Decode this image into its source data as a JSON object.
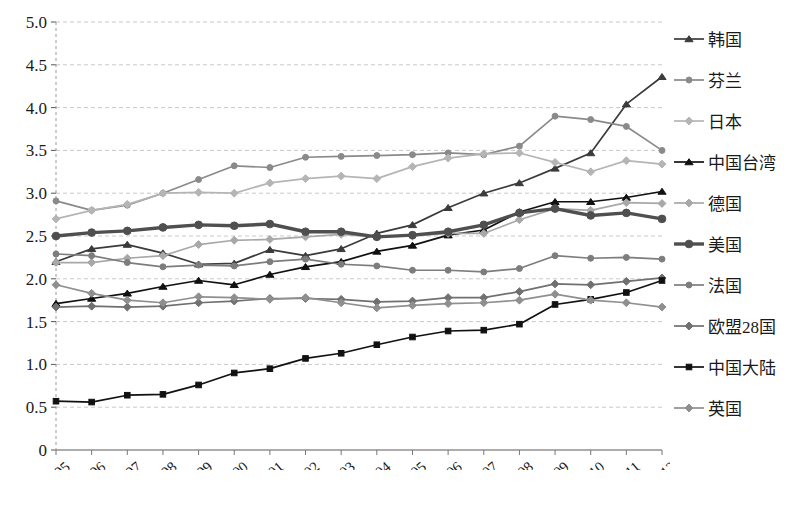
{
  "chart_data": {
    "type": "line",
    "title": "",
    "xlabel": "",
    "ylabel": "",
    "ylim": [
      0,
      5.0
    ],
    "yticks": [
      "0",
      "0.5",
      "1.0",
      "1.5",
      "2.0",
      "2.5",
      "3.0",
      "3.5",
      "4.0",
      "4.5",
      "5.0"
    ],
    "grid": true,
    "legend_position": "right",
    "categories": [
      "1995",
      "1996",
      "1997",
      "1998",
      "1999",
      "2000",
      "2001",
      "2002",
      "2003",
      "2004",
      "2005",
      "2006",
      "2007",
      "2008",
      "2009",
      "2010",
      "2011",
      "2012"
    ],
    "series": [
      {
        "name": "韩国",
        "marker": "triangle",
        "color": "#3b3b3b",
        "values": [
          2.2,
          2.35,
          2.4,
          2.3,
          2.17,
          2.18,
          2.34,
          2.27,
          2.35,
          2.53,
          2.63,
          2.83,
          3.0,
          3.12,
          3.29,
          3.47,
          4.04,
          4.36
        ]
      },
      {
        "name": "芬兰",
        "marker": "circle",
        "color": "#8a8a8a",
        "values": [
          2.91,
          2.8,
          2.86,
          3.0,
          3.16,
          3.32,
          3.3,
          3.42,
          3.43,
          3.44,
          3.45,
          3.47,
          3.45,
          3.55,
          3.9,
          3.86,
          3.78,
          3.5
        ]
      },
      {
        "name": "日本",
        "marker": "diamond",
        "color": "#b5b5b5",
        "values": [
          2.7,
          2.8,
          2.87,
          3.0,
          3.01,
          3.0,
          3.12,
          3.17,
          3.2,
          3.17,
          3.31,
          3.41,
          3.46,
          3.47,
          3.36,
          3.25,
          3.38,
          3.34
        ]
      },
      {
        "name": "中国台湾",
        "marker": "triangle",
        "color": "#111111",
        "values": [
          1.71,
          1.77,
          1.83,
          1.91,
          1.98,
          1.93,
          2.05,
          2.14,
          2.2,
          2.32,
          2.39,
          2.51,
          2.57,
          2.78,
          2.9,
          2.9,
          2.95,
          3.02
        ]
      },
      {
        "name": "德国",
        "marker": "diamond",
        "color": "#a8a8a8",
        "values": [
          2.19,
          2.19,
          2.24,
          2.27,
          2.4,
          2.45,
          2.46,
          2.49,
          2.52,
          2.49,
          2.5,
          2.53,
          2.53,
          2.69,
          2.82,
          2.8,
          2.89,
          2.88
        ]
      },
      {
        "name": "美国",
        "marker": "circle",
        "color": "#4f4f4f",
        "values": [
          2.5,
          2.54,
          2.56,
          2.6,
          2.63,
          2.62,
          2.64,
          2.55,
          2.55,
          2.49,
          2.51,
          2.55,
          2.63,
          2.77,
          2.82,
          2.74,
          2.77,
          2.7
        ]
      },
      {
        "name": "法国",
        "marker": "circle",
        "color": "#7d7d7d",
        "values": [
          2.29,
          2.27,
          2.19,
          2.14,
          2.16,
          2.15,
          2.2,
          2.23,
          2.17,
          2.15,
          2.1,
          2.1,
          2.08,
          2.12,
          2.27,
          2.24,
          2.25,
          2.23
        ]
      },
      {
        "name": "欧盟28国",
        "marker": "diamond",
        "color": "#707070",
        "values": [
          1.67,
          1.68,
          1.67,
          1.68,
          1.72,
          1.74,
          1.77,
          1.77,
          1.76,
          1.73,
          1.74,
          1.78,
          1.78,
          1.85,
          1.94,
          1.93,
          1.97,
          2.01
        ]
      },
      {
        "name": "中国大陆",
        "marker": "square",
        "color": "#111111",
        "values": [
          0.57,
          0.56,
          0.64,
          0.65,
          0.76,
          0.9,
          0.95,
          1.07,
          1.13,
          1.23,
          1.32,
          1.39,
          1.4,
          1.47,
          1.7,
          1.76,
          1.84,
          1.98
        ]
      },
      {
        "name": "英国",
        "marker": "diamond",
        "color": "#8f8f8f",
        "values": [
          1.93,
          1.83,
          1.75,
          1.72,
          1.79,
          1.78,
          1.76,
          1.78,
          1.72,
          1.66,
          1.69,
          1.71,
          1.72,
          1.75,
          1.82,
          1.75,
          1.72,
          1.67
        ]
      }
    ]
  },
  "axis": {
    "y_values": [
      "5.0",
      "4.5",
      "4.0",
      "3.5",
      "3.0",
      "2.5",
      "2.0",
      "1.5",
      "1.0",
      "0.5",
      "0"
    ],
    "x_values": [
      "1995",
      "1996",
      "1997",
      "1998",
      "1999",
      "2000",
      "2001",
      "2002",
      "2003",
      "2004",
      "2005",
      "2006",
      "2007",
      "2008",
      "2009",
      "2010",
      "2011",
      "2012"
    ]
  },
  "legend": {
    "items": [
      {
        "label": "韩国"
      },
      {
        "label": "芬兰"
      },
      {
        "label": "日本"
      },
      {
        "label": "中国台湾"
      },
      {
        "label": "德国"
      },
      {
        "label": "美国"
      },
      {
        "label": "法国"
      },
      {
        "label": "欧盟28国"
      },
      {
        "label": "中国大陆"
      },
      {
        "label": "英国"
      }
    ]
  }
}
